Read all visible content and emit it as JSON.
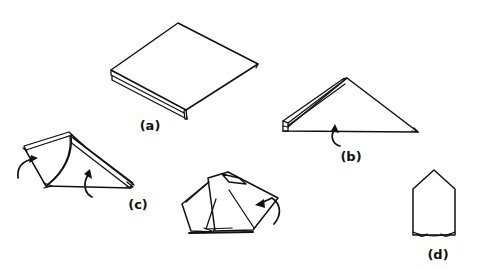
{
  "figure": {
    "background_color": "#ffffff",
    "ink_color": "#111111",
    "width": 477,
    "height": 270,
    "style": "black-and-white line art"
  },
  "panels": [
    {
      "id": "a",
      "label": "(a)",
      "label_x": 150,
      "label_y": 130,
      "description": "Square napkin folded flat, shown in perspective with layered open edges along the lower-left side",
      "shape": "square-flat-perspective",
      "arrows": 0
    },
    {
      "id": "b",
      "label": "(b)",
      "label_x": 351,
      "label_y": 161,
      "description": "Napkin folded into a triangle with the rolled layered edge at the left, curved arrow below the base indicating an upward fold",
      "shape": "triangle",
      "arrows": 1
    },
    {
      "id": "c",
      "label": "(c)",
      "label_x": 138,
      "label_y": 209,
      "description": "Triangle with one corner folded over, two curved arrows showing the next folds",
      "shape": "triangle-with-flap",
      "arrows": 2
    },
    {
      "id": "mid",
      "label": "",
      "label_x": 0,
      "label_y": 0,
      "description": "Overlapping folded flaps forming a crossed arrangement, curved arrow at the right indicating a tuck fold",
      "shape": "crossed-flaps",
      "arrows": 1
    },
    {
      "id": "d",
      "label": "(d)",
      "label_x": 438,
      "label_y": 259,
      "description": "Finished upright pentagon / house-shaped standing napkin with a pointed top",
      "shape": "pentagon-upright",
      "arrows": 0
    }
  ],
  "labels": {
    "a": "(a)",
    "b": "(b)",
    "c": "(c)",
    "d": "(d)"
  }
}
